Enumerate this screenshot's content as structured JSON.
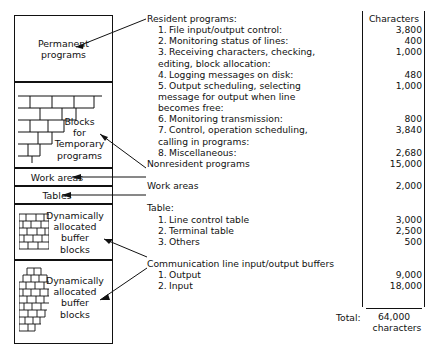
{
  "diagram": {
    "boxes": [
      {
        "name": "permanent-programs",
        "label": "Permanent\nprograms"
      },
      {
        "name": "blocks-for-temporary-programs",
        "label": "Blocks\nfor\nTemporary\nprograms"
      },
      {
        "name": "work-areas",
        "label": "Work  areas"
      },
      {
        "name": "tables",
        "label": "Tables"
      },
      {
        "name": "buffer-blocks-1",
        "label": "Dynamically\nallocated\nbuffer\nblocks"
      },
      {
        "name": "buffer-blocks-2",
        "label": "Dynamically\nallocated\nbuffer\nblocks"
      }
    ]
  },
  "listing": {
    "rows": [
      {
        "text": "Resident programs:",
        "indent": 0,
        "num": ""
      },
      {
        "text": "File input/output control:",
        "indent": 1,
        "num": "1."
      },
      {
        "text": "Monitoring status of lines:",
        "indent": 1,
        "num": "2."
      },
      {
        "text": "Receiving characters, checking,",
        "indent": 1,
        "num": "3."
      },
      {
        "text": "editing, block allocation:",
        "indent": 2,
        "num": ""
      },
      {
        "text": "Logging messages on disk:",
        "indent": 1,
        "num": "4."
      },
      {
        "text": "Output scheduling, selecting",
        "indent": 1,
        "num": "5."
      },
      {
        "text": "message for output when line",
        "indent": 2,
        "num": ""
      },
      {
        "text": "becomes free:",
        "indent": 2,
        "num": ""
      },
      {
        "text": "Monitoring transmission:",
        "indent": 1,
        "num": "6."
      },
      {
        "text": "Control, operation scheduling,",
        "indent": 1,
        "num": "7."
      },
      {
        "text": "calling in programs:",
        "indent": 2,
        "num": ""
      },
      {
        "text": "Miscellaneous:",
        "indent": 1,
        "num": "8."
      },
      {
        "text": "Nonresident programs",
        "indent": 0,
        "num": ""
      },
      {
        "text": "",
        "indent": 0,
        "num": ""
      },
      {
        "text": "Work areas",
        "indent": 0,
        "num": ""
      },
      {
        "text": "",
        "indent": 0,
        "num": ""
      },
      {
        "text": "Table:",
        "indent": 0,
        "num": ""
      },
      {
        "text": "Line control table",
        "indent": 1,
        "num": "1."
      },
      {
        "text": "Terminal table",
        "indent": 1,
        "num": "2."
      },
      {
        "text": "Others",
        "indent": 1,
        "num": "3."
      },
      {
        "text": "",
        "indent": 0,
        "num": ""
      },
      {
        "text": "Communication line input/output buffers",
        "indent": 0,
        "num": ""
      },
      {
        "text": "Output",
        "indent": 1,
        "num": "1."
      },
      {
        "text": "Input",
        "indent": 1,
        "num": "2."
      }
    ]
  },
  "characters": {
    "header": "Characters",
    "values": [
      "Characters",
      "3,800",
      "400",
      "1,000",
      "",
      "480",
      "1,000",
      "",
      "",
      "800",
      "3,840",
      "",
      "2,680",
      "15,000",
      "",
      "2,000",
      "",
      "",
      "3,000",
      "2,500",
      "500",
      "",
      "",
      "9,000",
      "18,000"
    ]
  },
  "total": {
    "label": "Total:",
    "value": "64,000",
    "units": "characters"
  }
}
